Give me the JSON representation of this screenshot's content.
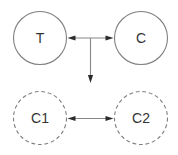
{
  "diagram": {
    "nodes": {
      "t": {
        "label": "T",
        "border": "solid"
      },
      "c": {
        "label": "C",
        "border": "solid"
      },
      "c1": {
        "label": "C1",
        "border": "dashed"
      },
      "c2": {
        "label": "C2",
        "border": "dashed"
      }
    },
    "edges": [
      {
        "from": "T",
        "to": "C",
        "style": "double-headed-arrow"
      },
      {
        "from": "T-C-midpoint",
        "to": "space-above-C1-C2",
        "style": "single-arrow-down"
      },
      {
        "from": "C1",
        "to": "C2",
        "style": "double-headed-arrow"
      }
    ],
    "colors": {
      "background": "#ffffff",
      "circle_stroke": "#7f7f7f",
      "edge_line": "#878787",
      "arrowhead": "#2b2b2b",
      "label_text": "#333333"
    }
  }
}
